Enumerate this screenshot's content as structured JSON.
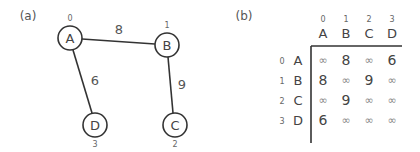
{
  "panels": {
    "a": "(a)",
    "b": "(b)"
  },
  "graph": {
    "nodes": [
      {
        "id": "A",
        "index": "0"
      },
      {
        "id": "B",
        "index": "1"
      },
      {
        "id": "C",
        "index": "2"
      },
      {
        "id": "D",
        "index": "3"
      }
    ],
    "edges": [
      {
        "from": "A",
        "to": "B",
        "weight": "8"
      },
      {
        "from": "A",
        "to": "D",
        "weight": "6"
      },
      {
        "from": "B",
        "to": "C",
        "weight": "9"
      }
    ]
  },
  "matrix": {
    "col_indices": [
      "0",
      "1",
      "2",
      "3"
    ],
    "col_labels": [
      "A",
      "B",
      "C",
      "D"
    ],
    "row_indices": [
      "0",
      "1",
      "2",
      "3"
    ],
    "row_labels": [
      "A",
      "B",
      "C",
      "D"
    ],
    "cells": [
      [
        "∞",
        "8",
        "∞",
        "6"
      ],
      [
        "8",
        "∞",
        "9",
        "∞"
      ],
      [
        "∞",
        "9",
        "∞",
        "∞"
      ],
      [
        "6",
        "∞",
        "∞",
        "∞"
      ]
    ]
  }
}
